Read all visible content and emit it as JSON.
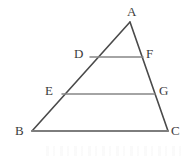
{
  "figure": {
    "type": "geometry-diagram",
    "shape": "triangle-with-parallel-lines",
    "background_color": "#ffffff",
    "side_stroke_color": "#4a4a4a",
    "parallel_stroke_color": "#878787",
    "base_stroke_color": "#7d7d7d",
    "label_color": "#3c3c3c",
    "canvas": {
      "width": 193,
      "height": 160
    }
  },
  "points": {
    "A": {
      "label": "A",
      "x": 130,
      "y": 22,
      "label_x": 127,
      "label_y": 5
    },
    "B": {
      "label": "B",
      "x": 32,
      "y": 131,
      "label_x": 15,
      "label_y": 124
    },
    "C": {
      "label": "C",
      "x": 168,
      "y": 131,
      "label_x": 171,
      "label_y": 124
    },
    "D": {
      "label": "D",
      "x": 90,
      "y": 57,
      "label_x": 74,
      "label_y": 47
    },
    "F": {
      "label": "F",
      "x": 143,
      "y": 57,
      "label_x": 146,
      "label_y": 47
    },
    "E": {
      "label": "E",
      "x": 62,
      "y": 94,
      "label_x": 45,
      "label_y": 84
    },
    "G": {
      "label": "G",
      "x": 155,
      "y": 94,
      "label_x": 159,
      "label_y": 84
    }
  },
  "segments": [
    {
      "name": "side-AB",
      "from": "A",
      "to": "B",
      "color": "#4a4a4a",
      "width": 1.6
    },
    {
      "name": "side-AC",
      "from": "A",
      "to": "C",
      "color": "#4a4a4a",
      "width": 1.6
    },
    {
      "name": "base-BC",
      "from": "B",
      "to": "C",
      "color": "#7d7d7d",
      "width": 1.9
    },
    {
      "name": "segment-DF",
      "from": "D",
      "to": "F",
      "color": "#878787",
      "width": 1.5
    },
    {
      "name": "segment-EG",
      "from": "E",
      "to": "G",
      "color": "#878787",
      "width": 1.5
    }
  ]
}
